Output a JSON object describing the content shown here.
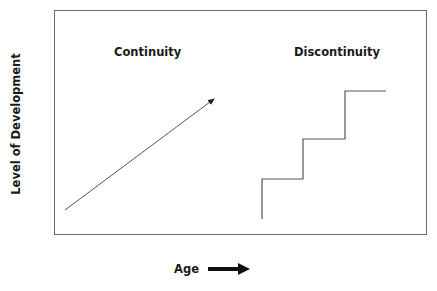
{
  "diagram": {
    "left_panel_title": "Continuity",
    "right_panel_title": "Discontinuity",
    "y_axis_label": "Level of Development",
    "x_axis_label": "Age",
    "line_color": "#555555",
    "continuity_line": {
      "from": [
        65,
        210
      ],
      "to": [
        215,
        98
      ],
      "has_arrowhead": true
    },
    "discontinuity_steps": [
      [
        262,
        219
      ],
      [
        262,
        179
      ],
      [
        303,
        179
      ],
      [
        303,
        139
      ],
      [
        345,
        139
      ],
      [
        345,
        91
      ],
      [
        386,
        91
      ]
    ]
  }
}
